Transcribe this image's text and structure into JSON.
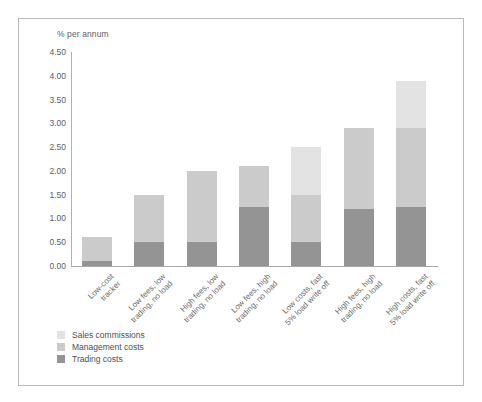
{
  "chart_data": {
    "type": "bar",
    "stacked": true,
    "title": "",
    "subtitle": "",
    "xlabel": "",
    "ylabel": "% per annum",
    "ylim": [
      0.0,
      4.5
    ],
    "ytick_step": 0.5,
    "ytick_labels": [
      "4.50",
      "4.00",
      "3.50",
      "3.00",
      "2.50",
      "2.00",
      "1.50",
      "1.00",
      "0.50",
      "0.00"
    ],
    "ytick_values": [
      4.5,
      4.0,
      3.5,
      3.0,
      2.5,
      2.0,
      1.5,
      1.0,
      0.5,
      0.0
    ],
    "grid": false,
    "legend_position": "bottom-left",
    "categories": [
      "Low-cost\ntracker",
      "Low fees, low\ntrading, no load",
      "High fees, low\ntrading, no load",
      "Low fees, high\ntrading, no load",
      "Low costs, fast\n5% load write off",
      "High fees, high\ntrading, no load",
      "High costs, fast\n5% load write off"
    ],
    "series": [
      {
        "name": "Trading costs",
        "color": "#949494",
        "values": [
          0.1,
          0.5,
          0.5,
          1.25,
          0.5,
          1.2,
          1.25
        ]
      },
      {
        "name": "Management costs",
        "color": "#cbcbcb",
        "values": [
          0.5,
          1.0,
          1.5,
          0.85,
          1.0,
          1.7,
          1.65
        ]
      },
      {
        "name": "Sales commissions",
        "color": "#e3e3e3",
        "values": [
          0.0,
          0.0,
          0.0,
          0.0,
          1.0,
          0.0,
          1.0
        ]
      }
    ],
    "totals": [
      0.6,
      1.5,
      2.0,
      2.1,
      2.5,
      2.9,
      3.9
    ]
  },
  "legend": {
    "items": [
      {
        "label": "Sales commissions",
        "color": "#e3e3e3"
      },
      {
        "label": "Management costs",
        "color": "#cbcbcb"
      },
      {
        "label": "Trading costs",
        "color": "#949494"
      }
    ]
  },
  "axis": {
    "y_title": "% per annum"
  }
}
